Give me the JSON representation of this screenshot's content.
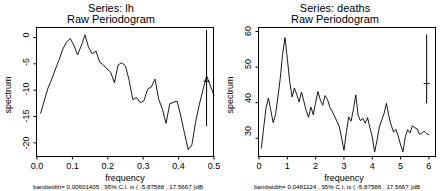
{
  "chart_data": [
    {
      "type": "line",
      "panel": "left",
      "title": "Series:  lh",
      "subtitle": "Raw Periodogram",
      "xlabel": "frequency",
      "ylabel": "spectrum",
      "caption": "bandwidth= 0.00601405 , 95% C.I. is ( -5.87588 , 17.5667 )dB",
      "bandwidth": 0.00601405,
      "ci_level": "95%",
      "ci_low_db": -5.87588,
      "ci_high_db": 17.5667,
      "xlim": [
        0.0,
        0.5
      ],
      "ylim": [
        -22.5,
        1.8
      ],
      "xticks": [
        0.0,
        0.1,
        0.2,
        0.3,
        0.4,
        0.5
      ],
      "xticklabels": [
        "0.0",
        "0.1",
        "0.2",
        "0.3",
        "0.4",
        "0.5"
      ],
      "yticks": [
        0,
        -5,
        -10,
        -15,
        -20
      ],
      "yticklabels": [
        "0",
        "-5",
        "-10",
        "-15",
        "-20"
      ],
      "grid": false,
      "legend": false,
      "ci_marker": {
        "x": 0.479,
        "low": -16.8,
        "high": 1.4,
        "tick": -8.3
      },
      "x": [
        0.0104,
        0.0208,
        0.0312,
        0.0417,
        0.0521,
        0.0625,
        0.0729,
        0.0833,
        0.0937,
        0.1042,
        0.1146,
        0.125,
        0.1354,
        0.1458,
        0.1562,
        0.1667,
        0.1771,
        0.1875,
        0.1979,
        0.2083,
        0.2187,
        0.2292,
        0.2396,
        0.25,
        0.2604,
        0.2708,
        0.2812,
        0.2917,
        0.3021,
        0.3125,
        0.3229,
        0.3333,
        0.3437,
        0.3542,
        0.3646,
        0.375,
        0.3854,
        0.3958,
        0.4062,
        0.4167,
        0.4271,
        0.4375,
        0.4479,
        0.4583,
        0.4687,
        0.4792,
        0.5
      ],
      "y": [
        -14.4,
        -11.9,
        -9.6,
        -7.9,
        -6.0,
        -4.2,
        -2.2,
        -0.9,
        -0.2,
        -1.5,
        -3.3,
        -1.6,
        0.5,
        -1.9,
        -3.1,
        -2.6,
        -4.7,
        -5.2,
        -6.0,
        -6.6,
        -8.6,
        -5.2,
        -4.8,
        -5.4,
        -8.2,
        -11.8,
        -11.4,
        -12.4,
        -12.0,
        -9.8,
        -9.4,
        -7.9,
        -11.7,
        -13.6,
        -16.3,
        -12.6,
        -12.3,
        -12.1,
        -14.9,
        -18.2,
        -21.3,
        -20.4,
        -16.1,
        -12.8,
        -10.0,
        -7.3,
        -11.0
      ]
    },
    {
      "type": "line",
      "panel": "right",
      "title": "Series:  deaths",
      "subtitle": "Raw Periodogram",
      "xlabel": "frequency",
      "ylabel": "spectrum",
      "caption": "bandwidth= 0.0481124 , 95% C.I. is ( -5.87588 , 17.5667 )dB",
      "bandwidth": 0.0481124,
      "ci_level": "95%",
      "ci_low_db": -5.87588,
      "ci_high_db": 17.5667,
      "xlim": [
        0.0,
        6.25
      ],
      "ylim": [
        25.0,
        61.0
      ],
      "xticks": [
        0,
        1,
        2,
        3,
        4,
        5,
        6
      ],
      "xticklabels": [
        "0",
        "1",
        "2",
        "3",
        "4",
        "5",
        "6"
      ],
      "yticks": [
        60,
        50,
        40,
        30
      ],
      "yticklabels": [
        "60",
        "50",
        "40",
        "30"
      ],
      "grid": false,
      "legend": false,
      "ci_marker": {
        "x": 5.92,
        "low": 39.8,
        "high": 59.2,
        "tick": 45.4
      },
      "x": [
        0.083,
        0.167,
        0.25,
        0.333,
        0.417,
        0.5,
        0.583,
        0.667,
        0.75,
        0.833,
        0.917,
        1.0,
        1.083,
        1.167,
        1.25,
        1.333,
        1.417,
        1.5,
        1.583,
        1.667,
        1.75,
        1.833,
        1.917,
        2.0,
        2.083,
        2.167,
        2.25,
        2.333,
        2.417,
        2.5,
        2.583,
        2.667,
        2.75,
        2.833,
        2.917,
        3.0,
        3.083,
        3.167,
        3.25,
        3.333,
        3.417,
        3.5,
        3.583,
        3.667,
        3.75,
        3.833,
        3.917,
        4.0,
        4.083,
        4.167,
        4.25,
        4.333,
        4.417,
        4.5,
        4.583,
        4.667,
        4.75,
        4.833,
        4.917,
        5.0,
        5.083,
        5.167,
        5.25,
        5.333,
        5.417,
        5.5,
        5.583,
        5.667,
        5.75,
        5.833,
        5.917,
        6.0
      ],
      "y": [
        27.2,
        33.1,
        38.6,
        41.3,
        37.8,
        34.4,
        36.6,
        41.5,
        46.8,
        53.6,
        58.3,
        52.4,
        46.0,
        41.6,
        44.1,
        42.3,
        40.2,
        43.0,
        40.4,
        37.7,
        35.9,
        38.8,
        36.6,
        40.1,
        43.1,
        40.7,
        39.3,
        42.0,
        40.9,
        38.8,
        37.6,
        36.2,
        34.8,
        33.4,
        30.1,
        26.6,
        31.6,
        36.0,
        34.8,
        38.0,
        42.2,
        36.5,
        34.9,
        35.6,
        34.2,
        35.8,
        33.0,
        30.4,
        26.1,
        29.4,
        33.2,
        35.1,
        37.0,
        39.8,
        36.3,
        33.7,
        31.7,
        32.5,
        30.6,
        28.1,
        26.2,
        30.4,
        32.4,
        31.5,
        33.5,
        33.0,
        32.6,
        31.1,
        31.4,
        32.0,
        31.3,
        31.0
      ]
    }
  ]
}
